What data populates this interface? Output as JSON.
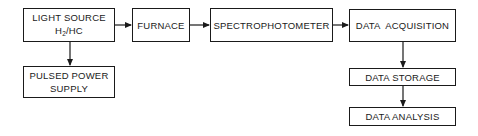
{
  "diagram": {
    "type": "block-flow",
    "nodes": [
      {
        "id": "light_source",
        "lines": [
          "LIGHT SOURCE",
          "H",
          "2",
          "/HC"
        ]
      },
      {
        "id": "pulsed_power_supply",
        "lines": [
          "PULSED POWER",
          "SUPPLY"
        ]
      },
      {
        "id": "furnace",
        "lines": [
          "FURNACE"
        ]
      },
      {
        "id": "spectrophotometer",
        "lines": [
          "SPECTROPHOTOMETER"
        ]
      },
      {
        "id": "data_acquisition",
        "lines": [
          "DATA  ACQUISITION"
        ]
      },
      {
        "id": "data_storage",
        "lines": [
          "DATA STORAGE"
        ]
      },
      {
        "id": "data_analysis",
        "lines": [
          "DATA ANALYSIS"
        ]
      }
    ],
    "edges": [
      {
        "from": "light_source",
        "to": "furnace"
      },
      {
        "from": "furnace",
        "to": "spectrophotometer"
      },
      {
        "from": "spectrophotometer",
        "to": "data_acquisition"
      },
      {
        "from": "light_source",
        "to": "pulsed_power_supply"
      },
      {
        "from": "data_acquisition",
        "to": "data_storage"
      },
      {
        "from": "data_storage",
        "to": "data_analysis"
      }
    ]
  },
  "labels": {
    "light_source_line1": "LIGHT SOURCE",
    "light_source_h": "H",
    "light_source_sub": "2",
    "light_source_rest": "/HC",
    "pulsed_line1": "PULSED POWER",
    "pulsed_line2": "SUPPLY",
    "furnace": "FURNACE",
    "spectrophotometer": "SPECTROPHOTOMETER",
    "data_acquisition": "DATA  ACQUISITION",
    "data_storage": "DATA STORAGE",
    "data_analysis": "DATA ANALYSIS"
  },
  "colors": {
    "stroke": "#1a1a1a",
    "background": "#ffffff"
  }
}
